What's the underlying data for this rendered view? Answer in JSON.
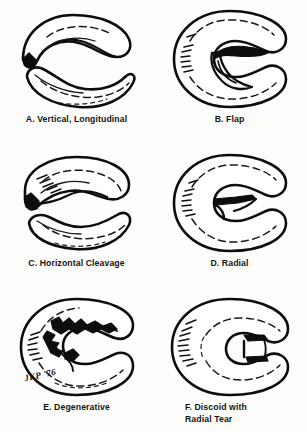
{
  "figure": {
    "background_color": "#fdfdfb",
    "ink_color": "#0d0d0d",
    "signature": "JKP '76"
  },
  "panels": [
    {
      "id": "a",
      "letter": "A.",
      "label": "A.  Vertical, Longitudinal",
      "caption_lines": [
        "A.  Vertical, Longitudinal"
      ]
    },
    {
      "id": "b",
      "letter": "B.",
      "label": "B.  Flap",
      "caption_lines": [
        "B.  Flap"
      ]
    },
    {
      "id": "c",
      "letter": "C.",
      "label": "C.  Horizontal Cleavage",
      "caption_lines": [
        "C.  Horizontal Cleavage"
      ]
    },
    {
      "id": "d",
      "letter": "D.",
      "label": "D.  Radial",
      "caption_lines": [
        "D.  Radial"
      ]
    },
    {
      "id": "e",
      "letter": "E.",
      "label": "E.  Degenerative",
      "caption_lines": [
        "E.  Degenerative"
      ]
    },
    {
      "id": "f",
      "letter": "F.",
      "label": "F.  Discoid with Radial Tear",
      "caption_lines": [
        "F.  Discoid with",
        "Radial Tear"
      ]
    }
  ]
}
